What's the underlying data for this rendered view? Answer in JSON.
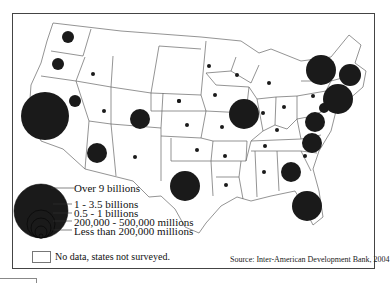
{
  "map": {
    "title": "",
    "source": "Source: Inter-American Development Bank, 2004",
    "colors": {
      "circle": "#1a1a1a",
      "border": "#555555",
      "background": "#ffffff"
    },
    "legend": {
      "items": [
        {
          "label": "Over 9 billions",
          "radius": 27
        },
        {
          "label": "1 - 3.5 billions",
          "radius": 14
        },
        {
          "label": "0.5 - 1 billions",
          "radius": 10
        },
        {
          "label": "200,000 - 500,000 millions",
          "radius": 6
        },
        {
          "label": "Less than 200,000 millions",
          "radius": 2
        }
      ],
      "no_data_label": "No data, states not surveyed."
    },
    "symbols": [
      {
        "region": "Washington",
        "x": 67,
        "y": 36,
        "r": 6
      },
      {
        "region": "Oregon",
        "x": 57,
        "y": 63,
        "r": 6
      },
      {
        "region": "California",
        "x": 44,
        "y": 115,
        "r": 24
      },
      {
        "region": "Nevada",
        "x": 74,
        "y": 100,
        "r": 6
      },
      {
        "region": "Idaho",
        "x": 92,
        "y": 73,
        "r": 2
      },
      {
        "region": "Utah",
        "x": 103,
        "y": 110,
        "r": 2
      },
      {
        "region": "Arizona",
        "x": 96,
        "y": 152,
        "r": 10
      },
      {
        "region": "Colorado",
        "x": 139,
        "y": 118,
        "r": 10
      },
      {
        "region": "New Mexico",
        "x": 134,
        "y": 156,
        "r": 2
      },
      {
        "region": "South Dakota",
        "x": 178,
        "y": 100,
        "r": 2
      },
      {
        "region": "Nebraska",
        "x": 178,
        "y": 100,
        "r": 2
      },
      {
        "region": "Kansas",
        "x": 186,
        "y": 124,
        "r": 2
      },
      {
        "region": "Oklahoma",
        "x": 196,
        "y": 149,
        "r": 2
      },
      {
        "region": "Texas",
        "x": 184,
        "y": 185,
        "r": 15
      },
      {
        "region": "Minnesota",
        "x": 208,
        "y": 65,
        "r": 2
      },
      {
        "region": "Iowa",
        "x": 214,
        "y": 94,
        "r": 2
      },
      {
        "region": "Missouri",
        "x": 221,
        "y": 126,
        "r": 2
      },
      {
        "region": "Arkansas",
        "x": 224,
        "y": 155,
        "r": 2
      },
      {
        "region": "Louisiana",
        "x": 225,
        "y": 184,
        "r": 2
      },
      {
        "region": "Wisconsin",
        "x": 236,
        "y": 74,
        "r": 2
      },
      {
        "region": "Illinois",
        "x": 243,
        "y": 113,
        "r": 15
      },
      {
        "region": "Michigan",
        "x": 268,
        "y": 82,
        "r": 2
      },
      {
        "region": "Indiana",
        "x": 262,
        "y": 112,
        "r": 2
      },
      {
        "region": "Ohio",
        "x": 283,
        "y": 106,
        "r": 2
      },
      {
        "region": "Kentucky",
        "x": 276,
        "y": 129,
        "r": 2
      },
      {
        "region": "Tennessee",
        "x": 264,
        "y": 145,
        "r": 2
      },
      {
        "region": "Alabama",
        "x": 263,
        "y": 171,
        "r": 2
      },
      {
        "region": "Georgia",
        "x": 290,
        "y": 171,
        "r": 10
      },
      {
        "region": "Florida",
        "x": 306,
        "y": 205,
        "r": 15
      },
      {
        "region": "South Carolina",
        "x": 304,
        "y": 155,
        "r": 2
      },
      {
        "region": "North Carolina",
        "x": 311,
        "y": 142,
        "r": 10
      },
      {
        "region": "Virginia",
        "x": 314,
        "y": 121,
        "r": 10
      },
      {
        "region": "Maryland",
        "x": 323,
        "y": 107,
        "r": 5
      },
      {
        "region": "Pennsylvania",
        "x": 312,
        "y": 95,
        "r": 2
      },
      {
        "region": "New York",
        "x": 320,
        "y": 69,
        "r": 15
      },
      {
        "region": "New Jersey",
        "x": 337,
        "y": 98,
        "r": 15
      },
      {
        "region": "Massachusetts",
        "x": 349,
        "y": 74,
        "r": 11
      }
    ]
  }
}
